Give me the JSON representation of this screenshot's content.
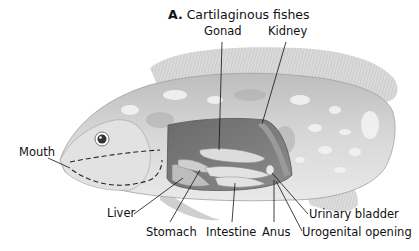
{
  "title": {
    "letter": "A.",
    "text": "Cartilaginous fishes"
  },
  "labels": {
    "gonad": "Gonad",
    "kidney": "Kidney",
    "mouth": "Mouth",
    "liver": "Liver",
    "stomach": "Stomach",
    "intestine": "Intestine",
    "anus": "Anus",
    "urinary_bladder": "Urinary bladder",
    "urogenital_opening": "Urogenital opening"
  },
  "colors": {
    "background": "#ffffff",
    "text": "#111111",
    "body_light": "#e8e8e8",
    "body_mid": "#c4c4c4",
    "body_dark": "#9a9a9a",
    "cavity": "#6e6e6e",
    "organ": "#d9d9d9"
  }
}
